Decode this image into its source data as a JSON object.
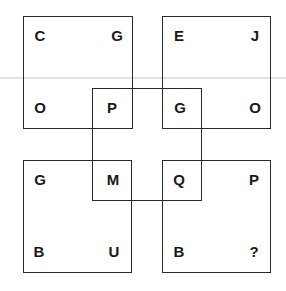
{
  "puzzle": {
    "type": "letter-grid-puzzle",
    "squares": [
      {
        "id": "top-left",
        "letters": {
          "tl": "C",
          "tr": "G",
          "bl": "O",
          "br": "P"
        }
      },
      {
        "id": "top-right",
        "letters": {
          "tl": "E",
          "tr": "J",
          "bl": "G",
          "br": "O"
        }
      },
      {
        "id": "bottom-left",
        "letters": {
          "tl": "G",
          "tr": "M",
          "bl": "B",
          "br": "U"
        }
      },
      {
        "id": "bottom-right",
        "letters": {
          "tl": "Q",
          "tr": "P",
          "bl": "B",
          "br": "?"
        }
      }
    ],
    "center_square": {
      "letters": [
        "P",
        "G",
        "M",
        "Q"
      ]
    },
    "missing_marker": "?"
  },
  "colors": {
    "stroke": "#2a2a2a",
    "text": "#1a1a1a",
    "background": "#ffffff"
  }
}
